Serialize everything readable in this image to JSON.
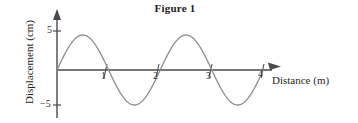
{
  "figure": {
    "title": "Figure 1"
  },
  "axes": {
    "x_title": "Distance (m)",
    "y_title": "Displacement (cm)",
    "x_ticks": [
      "1",
      "2",
      "3",
      "4"
    ],
    "y_ticks": [
      "5",
      "−5"
    ]
  },
  "colors": {
    "background": "#ffffff",
    "axis": "#4a4a4a",
    "curve": "#8a8a8a",
    "text": "#1f1f1f"
  },
  "chart_data": {
    "type": "line",
    "title": "Figure 1",
    "xlabel": "Distance (m)",
    "ylabel": "Displacement (cm)",
    "xlim": [
      0,
      4.2
    ],
    "ylim": [
      -6.5,
      6.5
    ],
    "xticks": [
      1,
      2,
      3,
      4
    ],
    "yticks": [
      5,
      -5
    ],
    "grid": false,
    "legend": null,
    "waveform": {
      "shape": "sine",
      "amplitude": 5,
      "wavelength": 2,
      "cycles": 2,
      "phase": 0,
      "equation": "y = 5 sin(pi x)"
    },
    "series": [
      {
        "name": "displacement",
        "x": [
          0,
          0.25,
          0.5,
          0.75,
          1,
          1.25,
          1.5,
          1.75,
          2,
          2.25,
          2.5,
          2.75,
          3,
          3.25,
          3.5,
          3.75,
          4
        ],
        "values": [
          0,
          3.54,
          5,
          3.54,
          0,
          -3.54,
          -5,
          -3.54,
          0,
          3.54,
          5,
          3.54,
          0,
          -3.54,
          -5,
          -3.54,
          0
        ]
      }
    ]
  }
}
